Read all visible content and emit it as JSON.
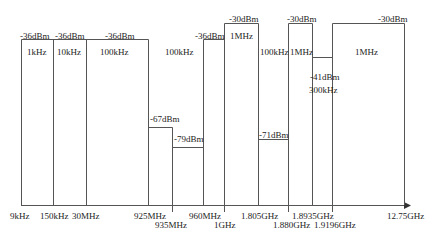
{
  "diagram": {
    "type": "spectrum-limit-mask",
    "axis": {
      "ticks": [
        {
          "label": "9kHz",
          "x": 21
        },
        {
          "label": "150kHz",
          "x": 53
        },
        {
          "label": "30MHz",
          "x": 86
        },
        {
          "label": "925MHz",
          "x": 148
        },
        {
          "label": "935MHz",
          "x": 172
        },
        {
          "label": "960MHz",
          "x": 203
        },
        {
          "label": "1GHz",
          "x": 224
        },
        {
          "label": "1.805GHz",
          "x": 258
        },
        {
          "label": "1.880GHz",
          "x": 288
        },
        {
          "label": "1.8935GHz",
          "x": 312
        },
        {
          "label": "1.9196GHz",
          "x": 332
        },
        {
          "label": "12.75GHz",
          "x": 404
        }
      ]
    },
    "bands": [
      {
        "start": "9kHz",
        "stop": "150kHz",
        "level": "-36dBm",
        "rbw": "1kHz"
      },
      {
        "start": "150kHz",
        "stop": "30MHz",
        "level": "-36dBm",
        "rbw": "10kHz"
      },
      {
        "start": "30MHz",
        "stop": "925MHz",
        "level": "-36dBm",
        "rbw": "100kHz"
      },
      {
        "start": "925MHz",
        "stop": "935MHz",
        "level": "-67dBm",
        "rbw": "100kHz"
      },
      {
        "start": "935MHz",
        "stop": "960MHz",
        "level": "-79dBm",
        "rbw": "100kHz"
      },
      {
        "start": "960MHz",
        "stop": "1GHz",
        "level": "-36dBm",
        "rbw": "100kHz"
      },
      {
        "start": "1GHz",
        "stop": "1.805GHz",
        "level": "-30dBm",
        "rbw": "1MHz"
      },
      {
        "start": "1.805GHz",
        "stop": "1.880GHz",
        "level": "-71dBm",
        "rbw": "100kHz"
      },
      {
        "start": "1.880GHz",
        "stop": "1.8935GHz",
        "level": "-30dBm",
        "rbw": "1MHz"
      },
      {
        "start": "1.8935GHz",
        "stop": "1.9196GHz",
        "level": "-41dBm",
        "rbw": "300kHz"
      },
      {
        "start": "1.9196GHz",
        "stop": "12.75GHz",
        "level": "-30dBm",
        "rbw": "1MHz"
      }
    ],
    "labels": {
      "l1": "-36dBm",
      "l2": "-36dBm",
      "l3": "-36dBm",
      "l4": "-67dBm",
      "l5": "-79dBm",
      "l6": "-36dBm",
      "l7": "-30dBm",
      "l8": "-71dBm",
      "l9": "-30dBm",
      "l10": "-41dBm",
      "l11": "-30dBm",
      "r1": "1kHz",
      "r2": "10kHz",
      "r3": "100kHz",
      "r4": "100kHz",
      "r5": "1MHz",
      "r6": "100kHz",
      "r7": "1MHz",
      "r8": "300kHz",
      "r9": "1MHz"
    }
  }
}
